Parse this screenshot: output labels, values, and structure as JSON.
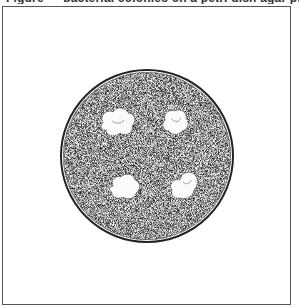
{
  "figure": {
    "caption": "Figure — bacterial colonies on a petri dish agar plate",
    "caption_visible": "cropped (only bottoms of glyphs visible at top edge)",
    "frame_color": "#555555",
    "background": "#ffffff"
  },
  "dish": {
    "label": "petri-dish",
    "center": [
      147,
      156
    ],
    "radius": 86,
    "rim_color": "#222222",
    "agar_texture": "stippled grey",
    "agar_color": "#d9d9d9"
  },
  "colonies": [
    {
      "label": "colony-1",
      "center": [
        117,
        123
      ],
      "size": [
        34,
        28
      ]
    },
    {
      "label": "colony-2",
      "center": [
        176,
        122
      ],
      "size": [
        26,
        26
      ]
    },
    {
      "label": "colony-3",
      "center": [
        126,
        187
      ],
      "size": [
        30,
        26
      ]
    },
    {
      "label": "colony-4",
      "center": [
        184,
        185
      ],
      "size": [
        30,
        28
      ]
    }
  ],
  "colony_count": 4
}
